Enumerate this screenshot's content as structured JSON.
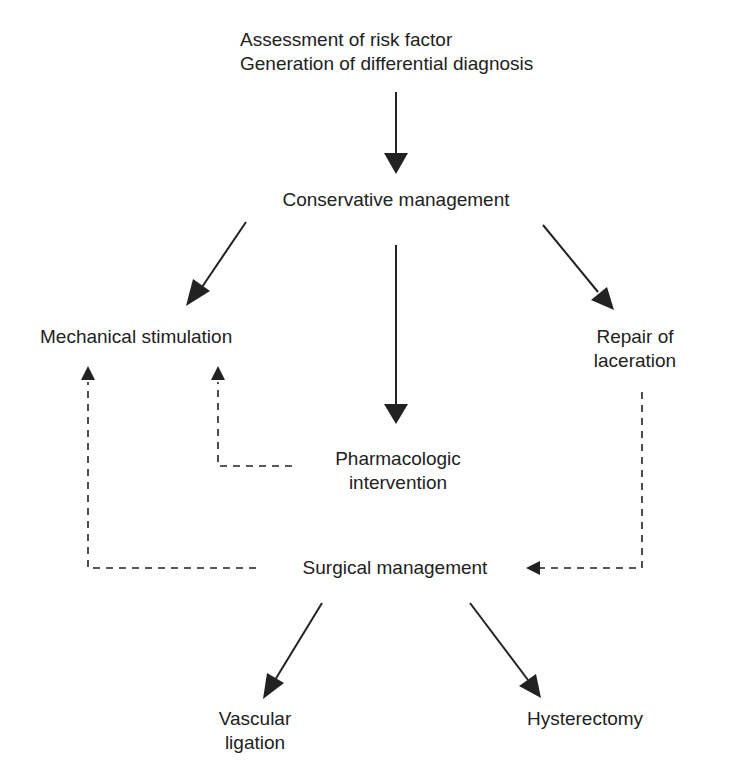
{
  "diagram": {
    "type": "flowchart",
    "colors": {
      "line": "#222222",
      "text": "#222222",
      "background": "#ffffff"
    },
    "nodes": {
      "assessment": {
        "line1": "Assessment of risk factor",
        "line2": "Generation of differential diagnosis"
      },
      "conservative": {
        "label": "Conservative management"
      },
      "mechanical": {
        "label": "Mechanical stimulation"
      },
      "repair": {
        "line1": "Repair of",
        "line2": "laceration"
      },
      "pharmacologic": {
        "line1": "Pharmacologic",
        "line2": "intervention"
      },
      "surgical": {
        "label": "Surgical management"
      },
      "vascular": {
        "line1": "Vascular",
        "line2": "ligation"
      },
      "hysterectomy": {
        "label": "Hysterectomy"
      }
    },
    "edges": [
      {
        "from": "assessment",
        "to": "conservative",
        "style": "solid"
      },
      {
        "from": "conservative",
        "to": "mechanical",
        "style": "solid"
      },
      {
        "from": "conservative",
        "to": "pharmacologic",
        "style": "solid"
      },
      {
        "from": "conservative",
        "to": "repair",
        "style": "solid"
      },
      {
        "from": "pharmacologic",
        "to": "mechanical",
        "style": "dashed"
      },
      {
        "from": "surgical",
        "to": "mechanical",
        "style": "dashed"
      },
      {
        "from": "repair",
        "to": "surgical",
        "style": "dashed"
      },
      {
        "from": "surgical",
        "to": "vascular",
        "style": "solid"
      },
      {
        "from": "surgical",
        "to": "hysterectomy",
        "style": "solid"
      }
    ]
  }
}
